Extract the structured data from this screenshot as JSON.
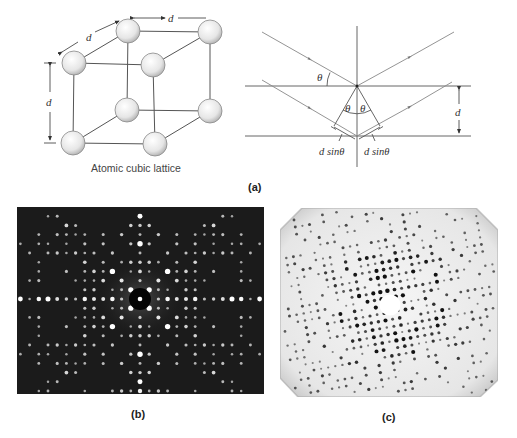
{
  "figure": {
    "panel_a": {
      "label": "(a)",
      "lattice": {
        "caption": "Atomic cubic lattice",
        "dimension_label": "d",
        "atoms": [
          {
            "id": "back-top-left",
            "x": 128,
            "y": 31
          },
          {
            "id": "back-top-right",
            "x": 210,
            "y": 32
          },
          {
            "id": "front-top-left",
            "x": 74,
            "y": 63
          },
          {
            "id": "front-top-right",
            "x": 153,
            "y": 65
          },
          {
            "id": "back-bottom-left",
            "x": 127,
            "y": 110
          },
          {
            "id": "back-bottom-right",
            "x": 210,
            "y": 111
          },
          {
            "id": "front-bottom-left",
            "x": 73,
            "y": 143
          },
          {
            "id": "front-bottom-right",
            "x": 155,
            "y": 144
          }
        ]
      },
      "bragg": {
        "angle_symbol": "θ",
        "spacing_label": "d",
        "path_difference_left": "d sinθ",
        "path_difference_right": "d sinθ"
      }
    },
    "panel_b": {
      "label": "(b)",
      "background": "#1a1a1a",
      "spot_color": "#ffffff"
    },
    "panel_c": {
      "label": "(c)",
      "background": "#eeeeee",
      "spot_color": "#111111"
    },
    "colors": {
      "line": "#555555",
      "atom_fill_light": "#ffffff",
      "atom_fill_dark": "#bdbdbd",
      "text": "#333333"
    }
  }
}
